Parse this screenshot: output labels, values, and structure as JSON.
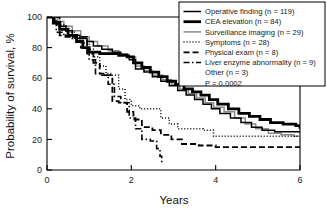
{
  "chart_data": {
    "type": "line",
    "title": "",
    "xlabel": "Years",
    "ylabel": "Probability of survival, %",
    "xlim": [
      0,
      6
    ],
    "ylim": [
      0,
      100
    ],
    "xticks": [
      0,
      2,
      4,
      6
    ],
    "yticks": [
      0,
      20,
      40,
      60,
      80,
      100
    ],
    "xticklabels": [
      "0",
      "2",
      "4",
      "6"
    ],
    "yticklabels": [
      "0",
      "20",
      "40",
      "60",
      "80",
      "100"
    ],
    "grid": false,
    "legend_position": "upper-right",
    "annotation": "P = 0.0002",
    "series": [
      {
        "name": "Operative finding",
        "label": "Operative finding (n = 119)",
        "n": 119,
        "style": "solid-thin",
        "color": "#000000",
        "width": 1.5,
        "points": [
          [
            0.0,
            100
          ],
          [
            0.18,
            97
          ],
          [
            0.32,
            94
          ],
          [
            0.45,
            91
          ],
          [
            0.6,
            88
          ],
          [
            0.78,
            86
          ],
          [
            0.95,
            84
          ],
          [
            1.1,
            81
          ],
          [
            1.3,
            79
          ],
          [
            1.55,
            77
          ],
          [
            1.75,
            75
          ],
          [
            1.95,
            72
          ],
          [
            2.1,
            66
          ],
          [
            2.3,
            64
          ],
          [
            2.5,
            61
          ],
          [
            2.7,
            58
          ],
          [
            2.9,
            55
          ],
          [
            3.1,
            52
          ],
          [
            3.3,
            49
          ],
          [
            3.5,
            46
          ],
          [
            3.7,
            43
          ],
          [
            3.9,
            40
          ],
          [
            4.1,
            37
          ],
          [
            4.35,
            34
          ],
          [
            4.6,
            31
          ],
          [
            4.85,
            28
          ],
          [
            5.1,
            26
          ],
          [
            5.4,
            25
          ],
          [
            5.7,
            25
          ],
          [
            6.0,
            25
          ]
        ]
      },
      {
        "name": "CEA elevation",
        "label": "CEA elevation (n = 84)",
        "n": 84,
        "style": "solid-thick",
        "color": "#000000",
        "width": 2.8,
        "points": [
          [
            0.0,
            100
          ],
          [
            0.15,
            96
          ],
          [
            0.3,
            92
          ],
          [
            0.5,
            88
          ],
          [
            0.7,
            84
          ],
          [
            0.85,
            80
          ],
          [
            1.0,
            77
          ],
          [
            1.25,
            76
          ],
          [
            1.5,
            76
          ],
          [
            1.7,
            75
          ],
          [
            1.9,
            74
          ],
          [
            2.05,
            70
          ],
          [
            2.25,
            67
          ],
          [
            2.45,
            64
          ],
          [
            2.65,
            61
          ],
          [
            2.85,
            58
          ],
          [
            3.05,
            56
          ],
          [
            3.25,
            53
          ],
          [
            3.45,
            51
          ],
          [
            3.65,
            49
          ],
          [
            3.85,
            46
          ],
          [
            4.05,
            43
          ],
          [
            4.3,
            40
          ],
          [
            4.55,
            37
          ],
          [
            4.8,
            35
          ],
          [
            5.05,
            33
          ],
          [
            5.3,
            31
          ],
          [
            5.6,
            30
          ],
          [
            5.9,
            29
          ],
          [
            6.0,
            27
          ]
        ]
      },
      {
        "name": "Surveillance imaging",
        "label": "Surveillance imaging (n = 29)",
        "n": 29,
        "style": "solid-gray",
        "color": "#8a8a8a",
        "width": 1.5,
        "points": [
          [
            0.0,
            100
          ],
          [
            0.2,
            97
          ],
          [
            0.4,
            94
          ],
          [
            0.6,
            91
          ],
          [
            0.8,
            87
          ],
          [
            1.0,
            84
          ],
          [
            1.2,
            81
          ],
          [
            1.45,
            78
          ],
          [
            1.7,
            76
          ],
          [
            1.9,
            74
          ],
          [
            2.1,
            68
          ],
          [
            2.3,
            65
          ],
          [
            2.5,
            62
          ],
          [
            2.75,
            59
          ],
          [
            2.95,
            56
          ],
          [
            3.15,
            53
          ],
          [
            3.35,
            50
          ],
          [
            3.55,
            47
          ],
          [
            3.75,
            44
          ],
          [
            3.95,
            41
          ],
          [
            4.2,
            38
          ],
          [
            4.45,
            34
          ],
          [
            4.7,
            30
          ],
          [
            4.95,
            27
          ],
          [
            5.25,
            24
          ],
          [
            5.55,
            23
          ],
          [
            5.85,
            22
          ],
          [
            6.0,
            22
          ]
        ]
      },
      {
        "name": "Symptoms",
        "label": "Symptoms (n = 28)",
        "n": 28,
        "style": "dotted",
        "color": "#000000",
        "width": 1.5,
        "points": [
          [
            0.0,
            100
          ],
          [
            0.25,
            95
          ],
          [
            0.45,
            90
          ],
          [
            0.65,
            86
          ],
          [
            0.85,
            83
          ],
          [
            1.0,
            79
          ],
          [
            1.1,
            74
          ],
          [
            1.25,
            68
          ],
          [
            1.4,
            63
          ],
          [
            1.55,
            62
          ],
          [
            1.7,
            53
          ],
          [
            1.85,
            46
          ],
          [
            2.0,
            42
          ],
          [
            2.2,
            40
          ],
          [
            2.45,
            40
          ],
          [
            2.7,
            34
          ],
          [
            2.9,
            30
          ],
          [
            3.1,
            27
          ],
          [
            3.4,
            27
          ],
          [
            3.7,
            26
          ],
          [
            3.95,
            22
          ],
          [
            4.4,
            22
          ],
          [
            5.0,
            22
          ],
          [
            5.5,
            22
          ],
          [
            6.0,
            22
          ]
        ]
      },
      {
        "name": "Physical exam",
        "label": "Physical exam (n = 8)",
        "n": 8,
        "style": "dashed",
        "color": "#000000",
        "width": 1.8,
        "points": [
          [
            0.0,
            100
          ],
          [
            0.3,
            88
          ],
          [
            0.55,
            87
          ],
          [
            0.8,
            87
          ],
          [
            0.95,
            76
          ],
          [
            1.1,
            70
          ],
          [
            1.25,
            63
          ],
          [
            1.4,
            62
          ],
          [
            1.55,
            45
          ],
          [
            1.7,
            44
          ],
          [
            1.9,
            38
          ],
          [
            2.05,
            33
          ],
          [
            2.25,
            28
          ],
          [
            2.5,
            26
          ],
          [
            2.7,
            23
          ],
          [
            2.95,
            20
          ],
          [
            3.2,
            17
          ],
          [
            3.6,
            16
          ],
          [
            4.0,
            15
          ],
          [
            4.6,
            15
          ],
          [
            5.2,
            15
          ],
          [
            5.7,
            15
          ],
          [
            6.0,
            15
          ]
        ]
      },
      {
        "name": "Liver enzyme abnormality",
        "label": "Liver enzyme abnormality (n = 9)",
        "n": 9,
        "style": "dash-dot",
        "color": "#000000",
        "width": 1.6,
        "points": [
          [
            0.0,
            100
          ],
          [
            0.22,
            90
          ],
          [
            0.4,
            87
          ],
          [
            0.6,
            86
          ],
          [
            0.8,
            80
          ],
          [
            1.0,
            72
          ],
          [
            1.15,
            63
          ],
          [
            1.3,
            62
          ],
          [
            1.45,
            56
          ],
          [
            1.6,
            48
          ],
          [
            1.75,
            44
          ],
          [
            1.95,
            34
          ],
          [
            2.1,
            27
          ],
          [
            2.25,
            20
          ],
          [
            2.45,
            19
          ],
          [
            2.6,
            14
          ],
          [
            2.68,
            9
          ],
          [
            2.72,
            4
          ]
        ]
      },
      {
        "name": "Other",
        "label": "Other (n = 3)",
        "n": 3,
        "style": "none",
        "color": "#000000",
        "width": 0,
        "points": []
      }
    ]
  },
  "legend": {
    "entries": [
      {
        "label": "Operative finding (n = 119)",
        "swatch": "solid-thin"
      },
      {
        "label": "CEA elevation (n = 84)",
        "swatch": "solid-thick"
      },
      {
        "label": "Surveillance imaging (n = 29)",
        "swatch": "solid-gray"
      },
      {
        "label": "Symptoms (n = 28)",
        "swatch": "dotted"
      },
      {
        "label": "Physical exam (n = 8)",
        "swatch": "dashed"
      },
      {
        "label": "Liver enzyme abnormality (n = 9)",
        "swatch": "dash-dot"
      },
      {
        "label": "Other (n = 3)",
        "swatch": "none"
      },
      {
        "label": "P = 0.0002",
        "swatch": "none"
      }
    ]
  },
  "axes": {
    "x_title": "Years",
    "y_title": "Probability of survival, %"
  }
}
